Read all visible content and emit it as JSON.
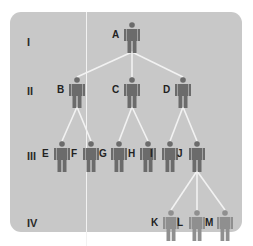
{
  "diagram": {
    "type": "pedigree",
    "colors": {
      "panel": "#c8c8c8",
      "lines": "#f2f2f2",
      "figure_dark": "#6b6b6b",
      "figure_light": "#8f8f8f",
      "text": "#222222"
    },
    "generations": [
      {
        "label": "I",
        "y": 43
      },
      {
        "label": "II",
        "y": 92
      },
      {
        "label": "III",
        "y": 157
      },
      {
        "label": "IV",
        "y": 224
      }
    ],
    "people": [
      {
        "id": "A",
        "gen": "I",
        "x": 132,
        "y": 35,
        "tone": "dark"
      },
      {
        "id": "B",
        "gen": "II",
        "x": 77,
        "y": 90,
        "tone": "dark"
      },
      {
        "id": "C",
        "gen": "II",
        "x": 132,
        "y": 90,
        "tone": "dark"
      },
      {
        "id": "D",
        "gen": "II",
        "x": 183,
        "y": 90,
        "tone": "dark"
      },
      {
        "id": "E",
        "gen": "III",
        "x": 62,
        "y": 154,
        "tone": "dark"
      },
      {
        "id": "F",
        "gen": "III",
        "x": 91,
        "y": 154,
        "tone": "dark"
      },
      {
        "id": "G",
        "gen": "III",
        "x": 119,
        "y": 154,
        "tone": "dark"
      },
      {
        "id": "H",
        "gen": "III",
        "x": 148,
        "y": 154,
        "tone": "dark"
      },
      {
        "id": "I",
        "gen": "III",
        "x": 170,
        "y": 154,
        "tone": "dark"
      },
      {
        "id": "J",
        "gen": "III",
        "x": 197,
        "y": 154,
        "tone": "dark"
      },
      {
        "id": "K",
        "gen": "IV",
        "x": 171,
        "y": 223,
        "tone": "light"
      },
      {
        "id": "L",
        "gen": "IV",
        "x": 197,
        "y": 223,
        "tone": "light"
      },
      {
        "id": "M",
        "gen": "IV",
        "x": 225,
        "y": 223,
        "tone": "light"
      }
    ],
    "edges": [
      [
        "A",
        "B"
      ],
      [
        "A",
        "C"
      ],
      [
        "A",
        "D"
      ],
      [
        "B",
        "E"
      ],
      [
        "B",
        "F"
      ],
      [
        "C",
        "G"
      ],
      [
        "C",
        "H"
      ],
      [
        "D",
        "I"
      ],
      [
        "D",
        "J"
      ],
      [
        "J",
        "K"
      ],
      [
        "J",
        "L"
      ],
      [
        "J",
        "M"
      ]
    ]
  }
}
